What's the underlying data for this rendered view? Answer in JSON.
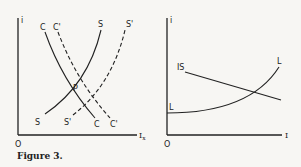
{
  "figure": {
    "caption": "Figure 3.",
    "left_panel": {
      "y_axis_label": "i",
      "x_axis_label": "Ix",
      "x_axis_label_main": "I",
      "x_axis_label_sub": "x",
      "origin_label": "O",
      "intersection_label": "P",
      "curves": [
        {
          "name": "C",
          "style": "solid",
          "top_label": "C",
          "bottom_label": "C"
        },
        {
          "name": "C'",
          "style": "dashed",
          "top_label": "C'",
          "bottom_label": "C'"
        },
        {
          "name": "S",
          "style": "solid",
          "top_label": "S",
          "bottom_label": "S"
        },
        {
          "name": "S'",
          "style": "dashed",
          "top_label": "S'",
          "bottom_label": "S'"
        }
      ]
    },
    "right_panel": {
      "y_axis_label": "i",
      "x_axis_label": "I",
      "origin_label": "O",
      "curves": [
        {
          "name": "IS",
          "style": "solid",
          "label": "IS"
        },
        {
          "name": "L",
          "style": "solid",
          "start_label": "L",
          "end_label": "L"
        }
      ]
    }
  }
}
